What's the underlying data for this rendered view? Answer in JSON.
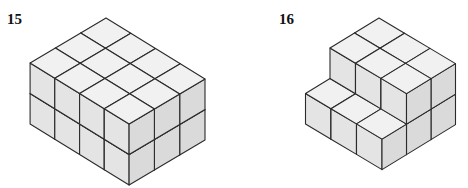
{
  "figures": [
    {
      "label": "15",
      "label_pos": [
        7,
        12
      ],
      "base_origin": [
        106,
        79
      ],
      "vec_l": [
        -25.3,
        15
      ],
      "vec_r": [
        24.75,
        15.25
      ],
      "cube_height": 30.5,
      "dims": {
        "along_left": 3,
        "along_right": 4,
        "height": 2
      },
      "cubes": [
        [
          0,
          0,
          0
        ],
        [
          0,
          1,
          0
        ],
        [
          0,
          2,
          0
        ],
        [
          0,
          3,
          0
        ],
        [
          1,
          0,
          0
        ],
        [
          1,
          1,
          0
        ],
        [
          1,
          2,
          0
        ],
        [
          1,
          3,
          0
        ],
        [
          2,
          0,
          0
        ],
        [
          2,
          1,
          0
        ],
        [
          2,
          2,
          0
        ],
        [
          2,
          3,
          0
        ],
        [
          0,
          0,
          1
        ],
        [
          0,
          1,
          1
        ],
        [
          0,
          2,
          1
        ],
        [
          0,
          3,
          1
        ],
        [
          1,
          0,
          1
        ],
        [
          1,
          1,
          1
        ],
        [
          1,
          2,
          1
        ],
        [
          1,
          3,
          1
        ],
        [
          2,
          0,
          1
        ],
        [
          2,
          1,
          1
        ],
        [
          2,
          2,
          1
        ],
        [
          2,
          3,
          1
        ]
      ]
    },
    {
      "label": "16",
      "label_pos": [
        279,
        12
      ],
      "base_origin": [
        379,
        79
      ],
      "vec_l": [
        -24.5,
        15
      ],
      "vec_r": [
        25.5,
        15.2
      ],
      "cube_height": 30.5,
      "dims": {
        "along_left": 3,
        "along_right": 3,
        "height": 2
      },
      "cubes": [
        [
          0,
          0,
          0
        ],
        [
          0,
          1,
          0
        ],
        [
          0,
          2,
          0
        ],
        [
          1,
          0,
          0
        ],
        [
          1,
          1,
          0
        ],
        [
          1,
          2,
          0
        ],
        [
          2,
          0,
          0
        ],
        [
          2,
          1,
          0
        ],
        [
          2,
          2,
          0
        ],
        [
          0,
          0,
          1
        ],
        [
          0,
          1,
          1
        ],
        [
          0,
          2,
          1
        ],
        [
          1,
          0,
          1
        ],
        [
          1,
          1,
          1
        ],
        [
          1,
          2,
          1
        ]
      ]
    }
  ],
  "colors": {
    "top_face": "#f1f1f1",
    "left_face": "#e4e4e4",
    "right_face": "#dadada",
    "edge": "#2b2b2b"
  }
}
